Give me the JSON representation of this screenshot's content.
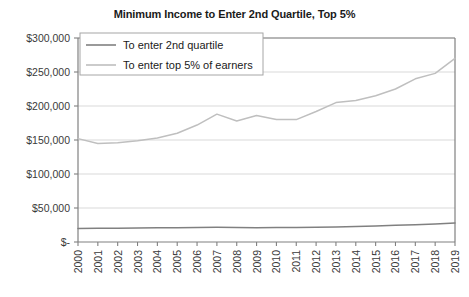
{
  "chart_data": {
    "type": "line",
    "title": "Minimum Income to Enter 2nd Quartile, Top 5%",
    "xlabel": "",
    "ylabel": "",
    "grid": true,
    "legend_position": "top-left-inside",
    "ylim": [
      0,
      300000
    ],
    "ytick_labels": [
      "$300,000",
      "$250,000",
      "$200,000",
      "$150,000",
      "$100,000",
      "$50,000",
      "$-"
    ],
    "ytick_values": [
      300000,
      250000,
      200000,
      150000,
      100000,
      50000,
      0
    ],
    "categories": [
      "2000",
      "2001",
      "2002",
      "2003",
      "2004",
      "2005",
      "2006",
      "2007",
      "2008",
      "2009",
      "2010",
      "2011",
      "2012",
      "2013",
      "2014",
      "2015",
      "2016",
      "2017",
      "2018",
      "2019"
    ],
    "series": [
      {
        "name": "To enter 2nd quartile",
        "color": "#808080",
        "values": [
          20000,
          20200,
          20300,
          20500,
          20800,
          21000,
          21500,
          21800,
          21500,
          21000,
          21200,
          21500,
          21800,
          22200,
          22800,
          23500,
          24500,
          25500,
          26500,
          28000
        ]
      },
      {
        "name": "To enter top 5% of earners",
        "color": "#bfbfbf",
        "values": [
          152000,
          145000,
          146000,
          149000,
          153000,
          160000,
          172000,
          188000,
          178000,
          186000,
          180000,
          180000,
          192000,
          205000,
          208000,
          215000,
          225000,
          240000,
          248000,
          270000
        ]
      }
    ]
  },
  "legend": {
    "items": [
      {
        "label": "To enter 2nd quartile",
        "color": "#808080"
      },
      {
        "label": "To enter top 5% of earners",
        "color": "#bfbfbf"
      }
    ]
  }
}
